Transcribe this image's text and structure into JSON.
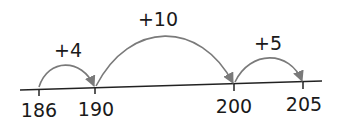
{
  "diagram": {
    "type": "number-line-jumps",
    "colors": {
      "line": "#222222",
      "arc": "#7a7a7a",
      "text": "#1a1a1a",
      "background": "#ffffff"
    },
    "ticks": [
      {
        "value": "186",
        "x": 39,
        "y": 89
      },
      {
        "value": "190",
        "x": 95,
        "y": 88
      },
      {
        "value": "200",
        "x": 234,
        "y": 84
      },
      {
        "value": "205",
        "x": 303,
        "y": 83
      }
    ],
    "jumps": [
      {
        "label": "+4",
        "from": "186",
        "to": "190"
      },
      {
        "label": "+10",
        "from": "190",
        "to": "200"
      },
      {
        "label": "+5",
        "from": "200",
        "to": "205"
      }
    ]
  }
}
